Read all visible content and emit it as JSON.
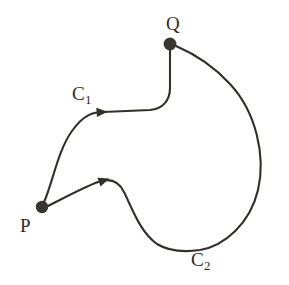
{
  "figure": {
    "background_color": "#ffffff",
    "stroke_color": "#332f2a",
    "point_color": "#3a352f",
    "label_color": "#2f2b27",
    "stroke_width": 2.1,
    "width": 289,
    "height": 285
  },
  "points": [
    {
      "id": "P",
      "label": "P",
      "x": 42,
      "y": 207,
      "radius": 6.2,
      "label_x": 20,
      "label_y": 216
    },
    {
      "id": "Q",
      "label": "Q",
      "x": 170,
      "y": 44,
      "radius": 6.4,
      "label_x": 166,
      "label_y": 14
    }
  ],
  "curves": [
    {
      "id": "C1",
      "label_main": "C",
      "label_sub": "1",
      "label_x": 72,
      "label_y": 84,
      "from": "P",
      "to": "Q",
      "path": "M 44 202 C 52 185 58 150 72 131 C 84 114 94 112 103 112 L 150 110 C 163 109 170 100 170 88 L 170 50",
      "arrow": {
        "x": 103,
        "y": 112,
        "angle_deg": 356
      }
    },
    {
      "id": "C2",
      "label_main": "C",
      "label_sub": "2",
      "label_x": 191,
      "label_y": 250,
      "from": "P",
      "to": "Q",
      "path": "M 48 206 C 62 199 82 188 98 182 C 109 178 118 180 124 192 C 132 208 140 232 157 244 C 170 252 186 252 200 250 C 224 246 250 224 258 190 C 266 156 256 112 230 84 C 210 62 190 52 176 46",
      "arrow": {
        "x": 105,
        "y": 180,
        "angle_deg": 340
      }
    }
  ]
}
